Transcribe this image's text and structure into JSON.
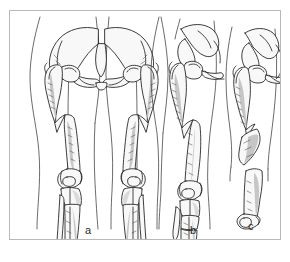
{
  "figure": {
    "kind": "medical-line-illustration",
    "background_color": "#ffffff",
    "frame_color": "#b9b9b9",
    "ink_color": "#1a1a1a",
    "bone_fill": "#f7f7f7",
    "shadow_fill": "#b5b5b5",
    "panel_count": 3
  },
  "panels": [
    {
      "id": "a",
      "caption": "a",
      "view": "bilateral anteroposterior lower limbs",
      "contents": "Pelvis with both hips, bilateral oblique femoral shaft fractures, knees, tibiae and fibulae"
    },
    {
      "id": "b",
      "caption": "b",
      "view": "single limb anteroposterior",
      "contents": "Hemipelvis and hip, oblique femoral shaft fracture, knee and fractured tibia"
    },
    {
      "id": "c",
      "caption": "c",
      "view": "single thigh anteroposterior",
      "contents": "Hemipelvis and hip with segmental femoral fracture and free intercalary fragment"
    }
  ],
  "captions": {
    "a": "a",
    "b": "b",
    "c": "c"
  }
}
